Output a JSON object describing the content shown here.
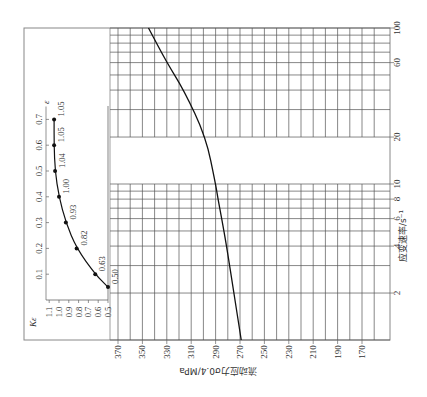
{
  "figure": {
    "orientation": "rotated-90-ccw",
    "colors": {
      "line": "#111111",
      "grid": "#555555",
      "frame": "#888888",
      "text": "#333333"
    }
  },
  "chart_data": [
    {
      "type": "line",
      "title": "",
      "xlabel": "应变速率/s⁻¹",
      "ylabel": "流动应力σ0.4/MPa",
      "x_scale": "log",
      "xlim": [
        1,
        100
      ],
      "ylim": [
        160,
        370
      ],
      "x_ticks": [
        "2",
        "4",
        "6",
        "8",
        "10",
        "20",
        "60",
        "100"
      ],
      "y_ticks": [
        "370",
        "350",
        "330",
        "310",
        "290",
        "270",
        "250",
        "230",
        "210",
        "190",
        "170"
      ],
      "grid": true,
      "series": [
        {
          "name": "σ0.4",
          "x": [
            1,
            2,
            4,
            6,
            8,
            10,
            20,
            40,
            60,
            100
          ],
          "y": [
            269,
            275,
            281,
            285,
            288,
            290,
            298,
            316,
            330,
            345
          ]
        }
      ]
    },
    {
      "type": "line",
      "title": "",
      "xlabel": "ε",
      "ylabel": "Kε",
      "xlim": [
        0,
        0.75
      ],
      "ylim": [
        0.45,
        1.1
      ],
      "x_ticks": [
        "0.1",
        "0.2",
        "0.3",
        "0.4",
        "0.5",
        "0.6",
        "0.7"
      ],
      "y_ticks": [
        "1.1",
        "1.0",
        "0.9",
        "0.8",
        "0.7",
        "0.6",
        "0.5"
      ],
      "grid": false,
      "series": [
        {
          "name": "Kε",
          "x": [
            0.05,
            0.1,
            0.2,
            0.3,
            0.4,
            0.5,
            0.6,
            0.7
          ],
          "y": [
            0.5,
            0.63,
            0.82,
            0.93,
            1.0,
            1.04,
            1.05,
            1.05
          ],
          "point_labels": [
            "0.50",
            "0.63",
            "0.82",
            "0.93",
            "1.00",
            "1.04",
            "1.05",
            "1.05"
          ]
        }
      ]
    }
  ],
  "inset": {
    "x_axis_label": "ε",
    "y_axis_label": "Kε",
    "x_ticks": [
      "0.1",
      "0.2",
      "0.3",
      "0.4",
      "0.5",
      "0.6",
      "0.7"
    ],
    "y_ticks": [
      "1.1",
      "1.0",
      "0.9",
      "0.8",
      "0.7",
      "0.6",
      "0.5"
    ],
    "point_labels": [
      "0.50",
      "0.63",
      "0.82",
      "0.93",
      "1.00",
      "1.04",
      "1.05",
      "1.05"
    ]
  },
  "main": {
    "x_axis_label": "应变速率/s⁻¹",
    "y_axis_label": "流动应力σ0.4/MPa",
    "x_ticks": [
      "2",
      "4",
      "6",
      "8",
      "10",
      "20",
      "60",
      "100"
    ],
    "y_ticks": [
      "370",
      "350",
      "330",
      "310",
      "290",
      "270",
      "250",
      "230",
      "210",
      "190",
      "170"
    ]
  }
}
